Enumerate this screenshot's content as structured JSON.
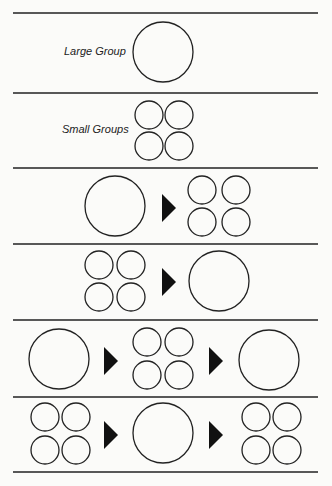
{
  "diagram": {
    "rows": [
      {
        "label": "Large Group",
        "sequence": [
          "large"
        ]
      },
      {
        "label": "Small Groups",
        "sequence": [
          "small"
        ]
      },
      {
        "label": "",
        "sequence": [
          "large",
          "arrow",
          "small"
        ]
      },
      {
        "label": "",
        "sequence": [
          "small",
          "arrow",
          "large"
        ]
      },
      {
        "label": "",
        "sequence": [
          "large",
          "arrow",
          "small",
          "arrow",
          "large"
        ]
      },
      {
        "label": "",
        "sequence": [
          "small",
          "arrow",
          "large",
          "arrow",
          "small"
        ]
      }
    ],
    "colors": {
      "line": "#222222",
      "background": "#fbfbf9",
      "arrow": "#111111"
    }
  }
}
